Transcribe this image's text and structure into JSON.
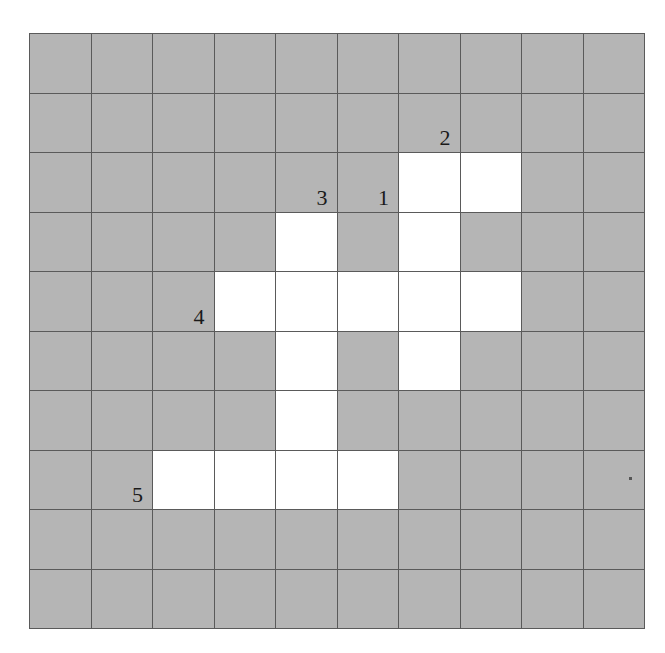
{
  "figure": {
    "name": "grid-polyomino-diagram",
    "rows": 10,
    "cols": 10,
    "shaded_color": "#b5b5b5",
    "open_color": "#ffffff",
    "grid_line_color": "#5a5a5a",
    "label_color": "#1a1a1a",
    "background_color": "#ffffff"
  },
  "cells": [
    [
      {
        "state": "shaded",
        "label": ""
      },
      {
        "state": "shaded",
        "label": ""
      },
      {
        "state": "shaded",
        "label": ""
      },
      {
        "state": "shaded",
        "label": ""
      },
      {
        "state": "shaded",
        "label": ""
      },
      {
        "state": "shaded",
        "label": ""
      },
      {
        "state": "shaded",
        "label": ""
      },
      {
        "state": "shaded",
        "label": ""
      },
      {
        "state": "shaded",
        "label": ""
      },
      {
        "state": "shaded",
        "label": ""
      }
    ],
    [
      {
        "state": "shaded",
        "label": ""
      },
      {
        "state": "shaded",
        "label": ""
      },
      {
        "state": "shaded",
        "label": ""
      },
      {
        "state": "shaded",
        "label": ""
      },
      {
        "state": "shaded",
        "label": ""
      },
      {
        "state": "shaded",
        "label": ""
      },
      {
        "state": "shaded",
        "label": "2"
      },
      {
        "state": "shaded",
        "label": ""
      },
      {
        "state": "shaded",
        "label": ""
      },
      {
        "state": "shaded",
        "label": ""
      }
    ],
    [
      {
        "state": "shaded",
        "label": ""
      },
      {
        "state": "shaded",
        "label": ""
      },
      {
        "state": "shaded",
        "label": ""
      },
      {
        "state": "shaded",
        "label": ""
      },
      {
        "state": "shaded",
        "label": "3"
      },
      {
        "state": "shaded",
        "label": "1"
      },
      {
        "state": "open",
        "label": ""
      },
      {
        "state": "open",
        "label": ""
      },
      {
        "state": "shaded",
        "label": ""
      },
      {
        "state": "shaded",
        "label": ""
      }
    ],
    [
      {
        "state": "shaded",
        "label": ""
      },
      {
        "state": "shaded",
        "label": ""
      },
      {
        "state": "shaded",
        "label": ""
      },
      {
        "state": "shaded",
        "label": ""
      },
      {
        "state": "open",
        "label": ""
      },
      {
        "state": "shaded",
        "label": ""
      },
      {
        "state": "open",
        "label": ""
      },
      {
        "state": "shaded",
        "label": ""
      },
      {
        "state": "shaded",
        "label": ""
      },
      {
        "state": "shaded",
        "label": ""
      }
    ],
    [
      {
        "state": "shaded",
        "label": ""
      },
      {
        "state": "shaded",
        "label": ""
      },
      {
        "state": "shaded",
        "label": "4"
      },
      {
        "state": "open",
        "label": ""
      },
      {
        "state": "open",
        "label": ""
      },
      {
        "state": "open",
        "label": ""
      },
      {
        "state": "open",
        "label": ""
      },
      {
        "state": "open",
        "label": ""
      },
      {
        "state": "shaded",
        "label": ""
      },
      {
        "state": "shaded",
        "label": ""
      }
    ],
    [
      {
        "state": "shaded",
        "label": ""
      },
      {
        "state": "shaded",
        "label": ""
      },
      {
        "state": "shaded",
        "label": ""
      },
      {
        "state": "shaded",
        "label": ""
      },
      {
        "state": "open",
        "label": ""
      },
      {
        "state": "shaded",
        "label": ""
      },
      {
        "state": "open",
        "label": ""
      },
      {
        "state": "shaded",
        "label": ""
      },
      {
        "state": "shaded",
        "label": ""
      },
      {
        "state": "shaded",
        "label": ""
      }
    ],
    [
      {
        "state": "shaded",
        "label": ""
      },
      {
        "state": "shaded",
        "label": ""
      },
      {
        "state": "shaded",
        "label": ""
      },
      {
        "state": "shaded",
        "label": ""
      },
      {
        "state": "open",
        "label": ""
      },
      {
        "state": "shaded",
        "label": ""
      },
      {
        "state": "shaded",
        "label": ""
      },
      {
        "state": "shaded",
        "label": ""
      },
      {
        "state": "shaded",
        "label": ""
      },
      {
        "state": "shaded",
        "label": ""
      }
    ],
    [
      {
        "state": "shaded",
        "label": ""
      },
      {
        "state": "shaded",
        "label": "5"
      },
      {
        "state": "open",
        "label": ""
      },
      {
        "state": "open",
        "label": ""
      },
      {
        "state": "open",
        "label": ""
      },
      {
        "state": "open",
        "label": ""
      },
      {
        "state": "shaded",
        "label": ""
      },
      {
        "state": "shaded",
        "label": ""
      },
      {
        "state": "shaded",
        "label": ""
      },
      {
        "state": "shaded",
        "label": "",
        "speck": true
      }
    ],
    [
      {
        "state": "shaded",
        "label": ""
      },
      {
        "state": "shaded",
        "label": ""
      },
      {
        "state": "shaded",
        "label": ""
      },
      {
        "state": "shaded",
        "label": ""
      },
      {
        "state": "shaded",
        "label": ""
      },
      {
        "state": "shaded",
        "label": ""
      },
      {
        "state": "shaded",
        "label": ""
      },
      {
        "state": "shaded",
        "label": ""
      },
      {
        "state": "shaded",
        "label": ""
      },
      {
        "state": "shaded",
        "label": ""
      }
    ],
    [
      {
        "state": "shaded",
        "label": ""
      },
      {
        "state": "shaded",
        "label": ""
      },
      {
        "state": "shaded",
        "label": ""
      },
      {
        "state": "shaded",
        "label": ""
      },
      {
        "state": "shaded",
        "label": ""
      },
      {
        "state": "shaded",
        "label": ""
      },
      {
        "state": "shaded",
        "label": ""
      },
      {
        "state": "shaded",
        "label": ""
      },
      {
        "state": "shaded",
        "label": ""
      },
      {
        "state": "shaded",
        "label": ""
      }
    ]
  ]
}
